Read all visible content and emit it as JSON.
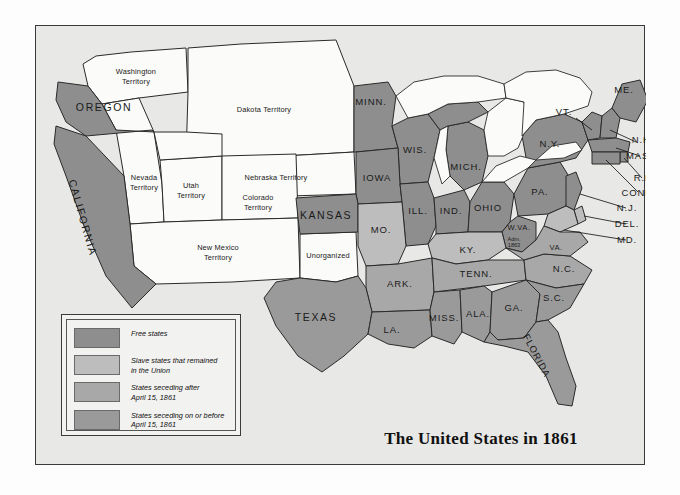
{
  "map": {
    "title": "The United States in 1861",
    "colors": {
      "free": "#8e8e8e",
      "slave_union": "#bdbdbd",
      "seceding_after": "#a8a8a8",
      "seceding_before": "#9a9a9a",
      "territory": "#fbfbf9",
      "water": "#fbfbf9",
      "background": "#e8e8e6",
      "outline": "#2a2a2a",
      "text": "#1a1a1a"
    },
    "legend": [
      {
        "swatch": "#8e8e8e",
        "label": "Free states"
      },
      {
        "swatch": "#bdbdbd",
        "label": "Slave states that remained\nin the Union"
      },
      {
        "swatch": "#a8a8a8",
        "label": "States seceding after\nApril 15, 1861"
      },
      {
        "swatch": "#9a9a9a",
        "label": "States seceding on or before\nApril 15, 1861"
      }
    ],
    "regions": {
      "free_states": [
        "OREGON",
        "CALIFORNIA",
        "KANSAS",
        "MINN.",
        "WIS.",
        "IOWA",
        "ILL.",
        "IND.",
        "MICH.",
        "OHIO",
        "PA.",
        "N.Y.",
        "VT.",
        "N.H.",
        "ME.",
        "MASS.",
        "R.I.",
        "CONN.",
        "N.J.",
        "W.VA."
      ],
      "slave_union_states": [
        "MO.",
        "KY.",
        "DEL.",
        "MD."
      ],
      "seceding_after_apr15": [
        "ARK.",
        "TENN.",
        "N.C.",
        "VA."
      ],
      "seceding_on_or_before_apr15": [
        "TEXAS",
        "LA.",
        "MISS.",
        "ALA.",
        "GA.",
        "FLORIDA",
        "S.C."
      ],
      "territories": [
        "Washington Territory",
        "Dakota Territory",
        "Nebraska Territory",
        "Nevada Territory",
        "Utah Territory",
        "Colorado Territory",
        "New Mexico Territory",
        "Unorganized"
      ]
    },
    "labels": {
      "washington_territory": "Washington\nTerritory",
      "dakota_territory": "Dakota Territory",
      "nebraska_territory": "Nebraska Territory",
      "nevada_territory": "Nevada\nTerritory",
      "utah_territory": "Utah\nTerritory",
      "colorado_territory": "Colorado\nTerritory",
      "new_mexico_territory": "New Mexico\nTerritory",
      "unorganized": "Unorganized",
      "oregon": "OREGON",
      "california": "CALIFORNIA",
      "kansas": "KANSAS",
      "texas": "TEXAS",
      "minn": "MINN.",
      "wis": "WIS.",
      "iowa": "IOWA",
      "mich": "MICH.",
      "ill": "ILL.",
      "ind": "IND.",
      "ohio": "OHIO",
      "mo": "MO.",
      "ky": "KY.",
      "ark": "ARK.",
      "tenn": "TENN.",
      "miss": "MISS.",
      "ala": "ALA.",
      "ga": "GA.",
      "la": "LA.",
      "sc": "S.C.",
      "nc": "N.C.",
      "florida": "FLORIDA",
      "va": "VA.",
      "wva": "W.VA.",
      "wva_note": "Adm.\n1863",
      "pa": "PA.",
      "ny": "N.Y.",
      "vt": "VT.",
      "nh": "N.H.",
      "me": "ME.",
      "mass": "MASS.",
      "ri": "R.I.",
      "conn": "CONN.",
      "nj": "N.J.",
      "del": "DEL.",
      "md": "MD."
    }
  }
}
